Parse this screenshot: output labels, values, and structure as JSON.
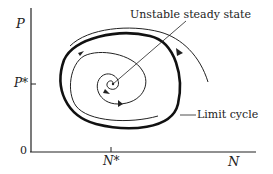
{
  "diagram": {
    "type": "phase-plane",
    "y_axis_label": "P",
    "y_tick_label": "P*",
    "x_axis_label": "N",
    "x_tick_label": "N*",
    "origin_label": "0",
    "annotations": {
      "unstable_steady_state": "Unstable steady state",
      "limit_cycle": "Limit cycle"
    },
    "colors": {
      "ink": "#222222",
      "background": "#ffffff"
    }
  }
}
